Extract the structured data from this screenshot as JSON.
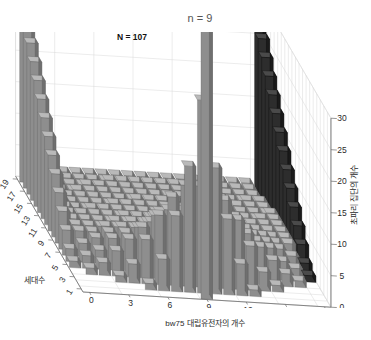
{
  "figure": {
    "title": "n = 9",
    "annotation": "N = 107",
    "background_color": "#ffffff",
    "grid_color": "#d8d8d8",
    "axis_color": "#6b6b6b"
  },
  "axes": {
    "x": {
      "label": "bw75 대립유전자의 개수",
      "ticks": [
        "0",
        "3",
        "6",
        "9",
        "12",
        "15",
        "18"
      ],
      "range": [
        0,
        18
      ]
    },
    "y": {
      "label": "세대수",
      "ticks": [
        "1",
        "3",
        "5",
        "7",
        "9",
        "11",
        "13",
        "15",
        "17",
        "19"
      ],
      "range": [
        1,
        19
      ]
    },
    "z": {
      "label": "초파리 집단의 개수",
      "ticks": [
        "0",
        "5",
        "10",
        "15",
        "20",
        "25",
        "30"
      ],
      "range": [
        0,
        30
      ]
    }
  },
  "chart_data": {
    "type": "bar",
    "title": "n = 9",
    "xlabel": "bw75 대립유전자의 개수",
    "ylabel": "세대수",
    "zlabel": "초파리 집단의 개수",
    "xlim": [
      0,
      18
    ],
    "ylim": [
      1,
      19
    ],
    "zlim": [
      0,
      30
    ],
    "grid": true,
    "legend": null,
    "annotations": [
      {
        "text": "N = 107",
        "x": 3,
        "y": 19,
        "z": 107,
        "note": "tallest bar is clipped by the z-axis limit of 30"
      }
    ],
    "x_categories": [
      0,
      1,
      2,
      3,
      4,
      5,
      6,
      7,
      8,
      9,
      10,
      11,
      12,
      13,
      14,
      15,
      16,
      17,
      18
    ],
    "y_categories": [
      1,
      2,
      3,
      4,
      5,
      6,
      7,
      8,
      9,
      10,
      11,
      12,
      13,
      14,
      15,
      16,
      17,
      18,
      19
    ],
    "note": "3-D histogram of bw75 allele counts (0-18) across 19 generations. Rows are generations; each row is a frequency distribution of allele copy number among Drosophila populations. Distribution starts centered at 9 in generation 1 and drifts to fixation at 0 and 18 over generations.",
    "series": [
      {
        "name": "generation 1",
        "values": [
          0,
          0,
          0,
          0,
          0,
          0,
          0,
          0,
          0,
          107,
          0,
          0,
          0,
          0,
          0,
          0,
          0,
          0,
          0
        ]
      },
      {
        "name": "generation 2",
        "values": [
          0,
          0,
          0,
          0,
          0,
          1,
          5,
          12,
          20,
          31,
          20,
          12,
          5,
          1,
          0,
          0,
          0,
          0,
          0
        ]
      },
      {
        "name": "generation 3",
        "values": [
          0,
          0,
          0,
          1,
          3,
          7,
          11,
          14,
          16,
          16,
          16,
          14,
          11,
          7,
          3,
          1,
          0,
          0,
          0
        ]
      },
      {
        "name": "generation 4",
        "values": [
          0,
          1,
          2,
          4,
          6,
          8,
          10,
          11,
          11,
          11,
          11,
          11,
          10,
          8,
          6,
          4,
          2,
          1,
          0
        ]
      },
      {
        "name": "generation 5",
        "values": [
          1,
          2,
          3,
          5,
          6,
          7,
          8,
          9,
          9,
          9,
          9,
          9,
          8,
          7,
          6,
          5,
          3,
          2,
          1
        ]
      },
      {
        "name": "generation 6",
        "values": [
          2,
          3,
          4,
          5,
          6,
          6,
          7,
          7,
          8,
          8,
          8,
          7,
          7,
          6,
          6,
          5,
          4,
          3,
          2
        ]
      },
      {
        "name": "generation 7",
        "values": [
          4,
          4,
          4,
          5,
          5,
          6,
          6,
          6,
          7,
          7,
          7,
          6,
          6,
          6,
          5,
          5,
          4,
          4,
          4
        ]
      },
      {
        "name": "generation 8",
        "values": [
          6,
          4,
          4,
          4,
          5,
          5,
          5,
          6,
          6,
          6,
          6,
          6,
          5,
          5,
          5,
          4,
          4,
          4,
          6
        ]
      },
      {
        "name": "generation 9",
        "values": [
          8,
          4,
          4,
          4,
          4,
          5,
          5,
          5,
          5,
          5,
          5,
          5,
          5,
          5,
          4,
          4,
          4,
          4,
          8
        ]
      },
      {
        "name": "generation 10",
        "values": [
          10,
          4,
          4,
          4,
          4,
          4,
          4,
          4,
          5,
          5,
          5,
          4,
          4,
          4,
          4,
          4,
          4,
          4,
          10
        ]
      },
      {
        "name": "generation 11",
        "values": [
          12,
          4,
          3,
          4,
          4,
          4,
          4,
          4,
          4,
          4,
          4,
          4,
          4,
          4,
          4,
          3,
          4,
          4,
          12
        ]
      },
      {
        "name": "generation 12",
        "values": [
          14,
          4,
          3,
          3,
          3,
          4,
          4,
          4,
          4,
          4,
          4,
          4,
          4,
          3,
          3,
          3,
          3,
          4,
          14
        ]
      },
      {
        "name": "generation 13",
        "values": [
          16,
          3,
          3,
          3,
          3,
          3,
          3,
          4,
          4,
          4,
          4,
          4,
          3,
          3,
          3,
          3,
          3,
          3,
          16
        ]
      },
      {
        "name": "generation 14",
        "values": [
          18,
          3,
          3,
          3,
          3,
          3,
          3,
          3,
          3,
          3,
          3,
          3,
          3,
          3,
          3,
          3,
          3,
          3,
          18
        ]
      },
      {
        "name": "generation 15",
        "values": [
          20,
          3,
          2,
          3,
          3,
          3,
          3,
          3,
          3,
          3,
          3,
          3,
          3,
          3,
          3,
          2,
          3,
          3,
          20
        ]
      },
      {
        "name": "generation 16",
        "values": [
          22,
          2,
          2,
          2,
          3,
          3,
          3,
          3,
          3,
          3,
          3,
          3,
          3,
          3,
          2,
          2,
          2,
          2,
          22
        ]
      },
      {
        "name": "generation 17",
        "values": [
          24,
          2,
          2,
          2,
          2,
          2,
          3,
          3,
          3,
          3,
          3,
          3,
          3,
          2,
          2,
          2,
          2,
          2,
          24
        ]
      },
      {
        "name": "generation 18",
        "values": [
          26,
          2,
          2,
          2,
          2,
          2,
          2,
          2,
          2,
          2,
          2,
          2,
          2,
          2,
          2,
          2,
          2,
          2,
          26
        ]
      },
      {
        "name": "generation 19",
        "values": [
          29,
          2,
          2,
          2,
          2,
          2,
          2,
          2,
          2,
          2,
          2,
          2,
          2,
          2,
          2,
          2,
          2,
          2,
          29
        ]
      }
    ]
  }
}
